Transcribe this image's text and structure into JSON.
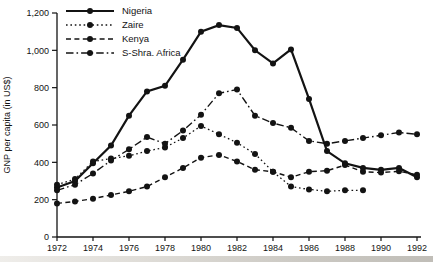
{
  "figure": {
    "background": "#ffffff",
    "ink_color": "#131313"
  },
  "chart_data": {
    "type": "line",
    "title": "",
    "xlabel": "",
    "ylabel": "GNP per capita (in US$)",
    "x": [
      1972,
      1973,
      1974,
      1975,
      1976,
      1977,
      1978,
      1979,
      1980,
      1981,
      1982,
      1983,
      1984,
      1985,
      1986,
      1987,
      1988,
      1989,
      1990,
      1991,
      1992
    ],
    "x_tick_years": [
      1972,
      1974,
      1976,
      1978,
      1980,
      1982,
      1984,
      1986,
      1988,
      1990,
      1992
    ],
    "x_tick_labels": [
      "1972",
      "1974",
      "1976",
      "1978",
      "1980",
      "1982",
      "1984",
      "1986",
      "1988",
      "1990",
      "1992"
    ],
    "y_ticks": [
      0,
      200,
      400,
      600,
      800,
      1000,
      1200
    ],
    "y_tick_labels": [
      "0",
      "200",
      "400",
      "600",
      "800",
      "1,000",
      "1,200"
    ],
    "xlim": [
      1972,
      1992
    ],
    "ylim": [
      0,
      1200
    ],
    "grid": false,
    "legend_position": "top-left",
    "series": [
      {
        "name": "Nigeria",
        "style": "solid",
        "values": [
          265,
          300,
          395,
          490,
          650,
          780,
          810,
          950,
          1100,
          1135,
          1120,
          1000,
          930,
          1005,
          740,
          460,
          395,
          370,
          360,
          370,
          320
        ]
      },
      {
        "name": "Zaire",
        "style": "dotted",
        "values": [
          280,
          310,
          405,
          420,
          435,
          460,
          480,
          530,
          595,
          550,
          505,
          445,
          350,
          270,
          255,
          245,
          250,
          250,
          null,
          null,
          null
        ]
      },
      {
        "name": "Kenya",
        "style": "dashed",
        "values": [
          180,
          190,
          205,
          225,
          245,
          270,
          320,
          370,
          425,
          440,
          405,
          360,
          350,
          320,
          350,
          355,
          385,
          350,
          345,
          352,
          333
        ]
      },
      {
        "name": "S-Shra. Africa",
        "style": "dashdot",
        "values": [
          250,
          280,
          340,
          410,
          470,
          535,
          500,
          570,
          655,
          770,
          790,
          650,
          610,
          585,
          515,
          500,
          515,
          530,
          545,
          560,
          550
        ]
      }
    ]
  }
}
